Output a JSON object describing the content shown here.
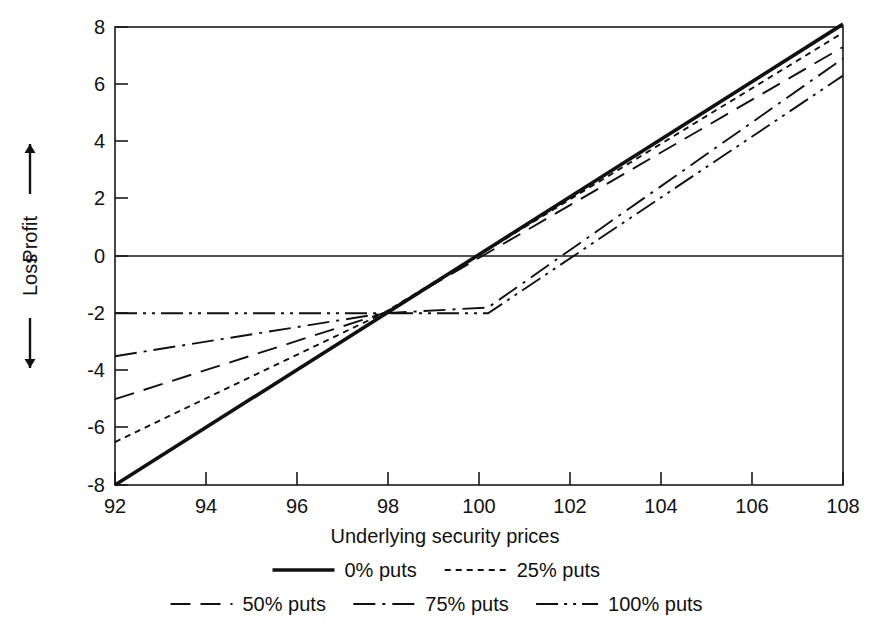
{
  "chart_data": {
    "type": "line",
    "title": "",
    "xlabel": "Underlying security prices",
    "ylabel_parts": [
      "Profit",
      "Loss"
    ],
    "ylabel_arrows": {
      "up": "↑",
      "down": "↓"
    },
    "xlim": [
      92,
      108
    ],
    "ylim": [
      -8,
      8
    ],
    "xticks": [
      92,
      94,
      96,
      98,
      100,
      102,
      104,
      106,
      108
    ],
    "yticks": [
      8,
      6,
      4,
      2,
      0,
      -2,
      -4,
      -6,
      -8
    ],
    "xtick_labels": [
      "92",
      "94",
      "96",
      "98",
      "100",
      "102",
      "104",
      "106",
      "108"
    ],
    "ytick_labels": [
      "8",
      "6",
      "4",
      "2",
      "0",
      "-2",
      "-4",
      "-6",
      "-8"
    ],
    "grid": false,
    "legend_position": "below",
    "zero_reference_line": 0,
    "series": [
      {
        "name": "0% puts",
        "style": "solid",
        "x": [
          92,
          108
        ],
        "values": [
          -8.0,
          8.1
        ]
      },
      {
        "name": "25% puts",
        "style": "dotted",
        "x": [
          92,
          97.9,
          108
        ],
        "values": [
          -6.5,
          -2.0,
          7.8
        ]
      },
      {
        "name": "50% puts",
        "style": "dashed",
        "x": [
          92,
          97.9,
          108
        ],
        "values": [
          -5.0,
          -2.0,
          7.3
        ]
      },
      {
        "name": "75% puts",
        "style": "dashdot",
        "x": [
          92,
          97.9,
          100.2,
          108
        ],
        "values": [
          -3.5,
          -2.0,
          -1.8,
          6.9
        ]
      },
      {
        "name": "100% puts",
        "style": "dashdotdot",
        "x": [
          92,
          97.9,
          100.2,
          108
        ],
        "values": [
          -2.0,
          -2.0,
          -2.0,
          6.3
        ]
      }
    ]
  },
  "legend": {
    "row1": [
      {
        "label": "0% puts",
        "style": "solid"
      },
      {
        "label": "25% puts",
        "style": "dotted"
      }
    ],
    "row2": [
      {
        "label": "50% puts",
        "style": "dashed"
      },
      {
        "label": "75% puts",
        "style": "dashdot"
      },
      {
        "label": "100% puts",
        "style": "dashdotdot"
      }
    ]
  },
  "axis": {
    "x_title": "Underlying security prices",
    "y_profit": "Profit",
    "y_loss": "Loss"
  }
}
